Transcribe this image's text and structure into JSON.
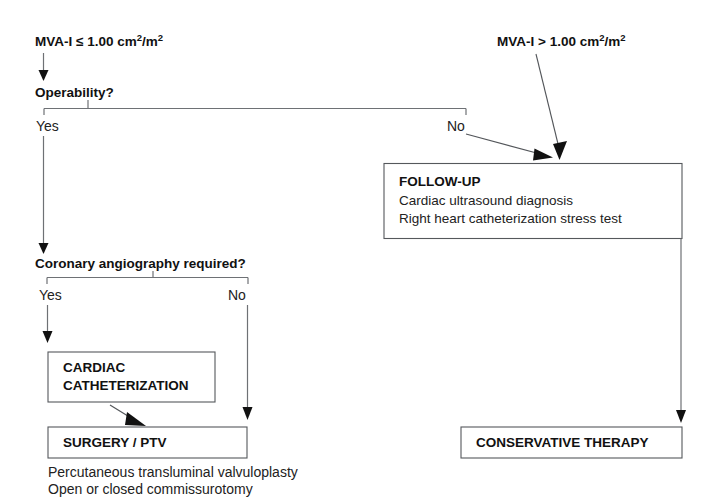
{
  "diagram": {
    "type": "clinical-decision-flowchart",
    "entry_left": {
      "text": "MVA-I ≤ 1.00 cm²/m²",
      "base": "MVA-I ≤ 1.00 cm",
      "sup1": "2",
      "mid": "/m",
      "sup2": "2"
    },
    "entry_right": {
      "text": "MVA-I > 1.00 cm²/m²",
      "base": "MVA-I > 1.00 cm",
      "sup1": "2",
      "mid": "/m",
      "sup2": "2"
    },
    "decisions": [
      {
        "id": "operability",
        "question": "Operability?",
        "yes_label": "Yes",
        "no_label": "No"
      },
      {
        "id": "coronary-angiography",
        "question": "Coronary angiography required?",
        "yes_label": "Yes",
        "no_label": "No"
      }
    ],
    "boxes": [
      {
        "id": "follow-up",
        "title": "FOLLOW-UP",
        "lines": [
          "Cardiac ultrasound diagnosis",
          "Right heart catheterization stress test"
        ]
      },
      {
        "id": "cardiac-catheterization",
        "title_line1": "CARDIAC",
        "title_line2": "CATHETERIZATION",
        "lines": []
      },
      {
        "id": "surgery-ptv",
        "title": "SURGERY / PTV",
        "lines": []
      },
      {
        "id": "conservative-therapy",
        "title": "CONSERVATIVE THERAPY",
        "lines": []
      }
    ],
    "footnotes": [
      "Percutaneous transluminal valvuloplasty",
      "Open or closed commissurotomy"
    ],
    "colors": {
      "background": "#ffffff",
      "text": "#111111",
      "box_border": "#55585c",
      "connector": "#6e7175",
      "arrowhead": "#111111"
    }
  }
}
